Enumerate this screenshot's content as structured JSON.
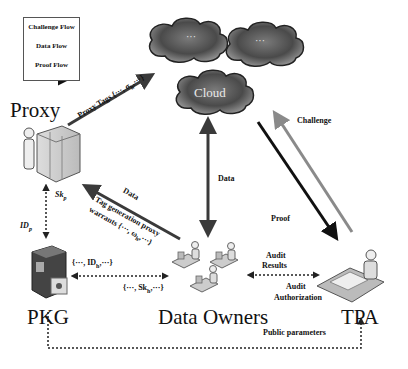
{
  "legend": {
    "challenge_flow": "Challenge Flow",
    "data_flow": "Data Flow",
    "proof_flow": "Proof Flow"
  },
  "nodes": {
    "proxy": "Proxy",
    "pkg": "PKG",
    "data_owners": "Data Owners",
    "tpa": "TPA",
    "cloud": "Cloud",
    "cloud_dots_1": "···",
    "cloud_dots_2": "···"
  },
  "edges": {
    "proxy_tags": "Proxy Tags {···, σ",
    "proxy_tags_sub": "h",
    "proxy_tags_end": ",···}",
    "data_cloud": "Data",
    "challenge": "Challenge",
    "proof": "Proof",
    "data_proxy": "Data",
    "tag_generation_1": "Tag generation proxy",
    "tag_generation_2": "warrants {···, ω",
    "tag_generation_sub": "h",
    "tag_generation_end": ",···}",
    "sk_p": "Sk",
    "sk_p_sub": "p",
    "id_p": "ID",
    "id_p_sub": "p",
    "id_h": "{···, ID",
    "id_h_sub": "h",
    "id_h_end": ",···}",
    "sk_h": "{···, Sk",
    "sk_h_sub": "h",
    "sk_h_end": ",···}",
    "audit_results_1": "Audit",
    "audit_results_2": "Results",
    "audit_auth_1": "Audit",
    "audit_auth_2": "Authorization",
    "public_parameters": "Public parameters"
  },
  "colors": {
    "challenge_arrow": "#8a8a8a",
    "data_arrow": "#3a3a3a",
    "proof_arrow": "#111111",
    "cloud_fill": "#5a5a5a",
    "text": "#111111"
  }
}
